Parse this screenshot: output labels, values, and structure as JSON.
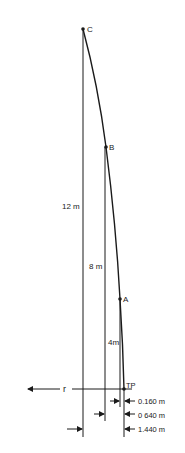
{
  "diagram": {
    "points": [
      {
        "id": "C",
        "label": "C",
        "x": 83,
        "y": 29
      },
      {
        "id": "B",
        "label": "B",
        "x": 106,
        "y": 147
      },
      {
        "id": "A",
        "label": "A",
        "x": 120,
        "y": 299
      },
      {
        "id": "TP",
        "label": "TP",
        "x": 124,
        "y": 389
      }
    ],
    "heights": [
      {
        "label": "12 m",
        "value_m": 12
      },
      {
        "label": "8 m",
        "value_m": 8
      },
      {
        "label": "4m",
        "value_m": 4
      }
    ],
    "radial_axis_label": "r",
    "offsets": [
      {
        "label": "0.160 m",
        "value_m": 0.16
      },
      {
        "label": "0 640 m",
        "value_m": 0.64
      },
      {
        "label": "1.440 m",
        "value_m": 1.44
      }
    ],
    "line_color": "#1a1a1a"
  }
}
